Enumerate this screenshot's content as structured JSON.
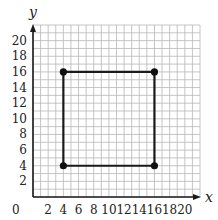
{
  "chart_data": {
    "type": "scatter",
    "title": "",
    "xlabel": "x",
    "ylabel": "y",
    "xlim": [
      0,
      22
    ],
    "ylim": [
      0,
      22
    ],
    "grid": true,
    "grid_step": 1,
    "x_ticks": [
      2,
      4,
      6,
      8,
      10,
      12,
      14,
      16,
      18,
      20
    ],
    "y_ticks": [
      2,
      4,
      6,
      8,
      10,
      12,
      14,
      16,
      18,
      20
    ],
    "origin_label": "0",
    "polygon": {
      "name": "rectangle",
      "closed": true,
      "vertices": [
        [
          4,
          16
        ],
        [
          16,
          16
        ],
        [
          16,
          4
        ],
        [
          4,
          4
        ]
      ]
    },
    "points": [
      {
        "x": 4,
        "y": 16
      },
      {
        "x": 16,
        "y": 16
      },
      {
        "x": 16,
        "y": 4
      },
      {
        "x": 4,
        "y": 4
      }
    ]
  }
}
